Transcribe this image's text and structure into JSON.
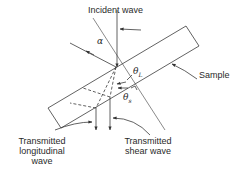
{
  "diagram": {
    "labels": {
      "incident_wave": "Incident wave",
      "sample": "Sample",
      "transmitted_longitudinal_line1": "Transmitted",
      "transmitted_longitudinal_line2": "longitudinal",
      "transmitted_longitudinal_line3": "wave",
      "transmitted_shear_line1": "Transmitted",
      "transmitted_shear_line2": "shear wave",
      "alpha": "α",
      "theta_L": "θ",
      "theta_L_sub": "L",
      "theta_s": "θ",
      "theta_s_sub": "s"
    },
    "colors": {
      "line": "#3a3a3a",
      "background": "#ffffff"
    }
  }
}
